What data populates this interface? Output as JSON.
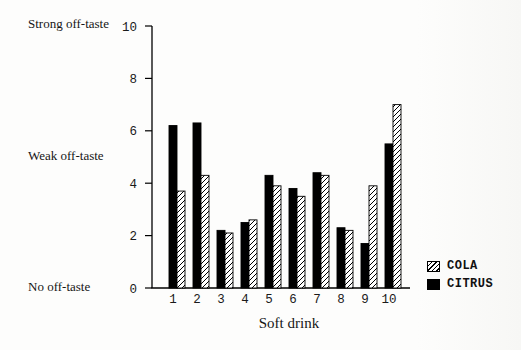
{
  "chart_data": {
    "type": "bar",
    "title": "",
    "xlabel": "Soft drink",
    "ylabel": "",
    "ylim": [
      0,
      10
    ],
    "y_ticks": [
      0,
      2,
      4,
      6,
      8,
      10
    ],
    "grid": false,
    "categories": [
      "1",
      "2",
      "3",
      "4",
      "5",
      "6",
      "7",
      "8",
      "9",
      "10"
    ],
    "series": [
      {
        "name": "CITRUS",
        "pattern": "solid",
        "color": "#000000",
        "slot": 0,
        "values": [
          6.2,
          6.3,
          2.2,
          2.5,
          4.3,
          3.8,
          4.4,
          2.3,
          1.7,
          5.5
        ]
      },
      {
        "name": "COLA",
        "pattern": "hatched",
        "color": "#000000",
        "slot": 1,
        "values": [
          3.7,
          4.3,
          2.1,
          2.6,
          3.9,
          3.5,
          4.3,
          2.2,
          3.9,
          7.0
        ]
      }
    ],
    "legend": {
      "position": "right-bottom",
      "entries": [
        {
          "label": "COLA",
          "swatch": "hatched"
        },
        {
          "label": "CITRUS",
          "swatch": "solid"
        }
      ]
    },
    "y_annotations": [
      {
        "value": 10,
        "label": "Strong off-taste"
      },
      {
        "value": 5,
        "label": "Weak off-taste"
      },
      {
        "value": 0,
        "label": "No off-taste"
      }
    ]
  }
}
